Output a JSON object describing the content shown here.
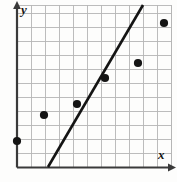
{
  "chart_data": {
    "type": "scatter",
    "title": "",
    "subtitle": "",
    "xlabel": "x",
    "ylabel": "y",
    "grid": true,
    "legend": null,
    "xlim": [
      0,
      11
    ],
    "ylim": [
      0,
      11.6
    ],
    "xticks": [
      0,
      1,
      2,
      3,
      4,
      5,
      6,
      7,
      8,
      9,
      10,
      11
    ],
    "yticks": [
      0,
      1,
      2,
      3,
      4,
      5,
      6,
      7,
      8,
      9,
      10,
      11
    ],
    "xticklabels": [],
    "yticklabels": [],
    "points": [
      {
        "x": 0.0,
        "y": 1.7
      },
      {
        "x": 2.0,
        "y": 3.4
      },
      {
        "x": 4.4,
        "y": 4.2
      },
      {
        "x": 6.3,
        "y": 5.9
      },
      {
        "x": 8.4,
        "y": 6.9
      },
      {
        "x": 10.4,
        "y": 9.6
      }
    ],
    "series": [
      {
        "name": "data-points",
        "type": "scatter",
        "marker": "filled-circle",
        "color": "#141414",
        "values": [
          [
            0.0,
            1.7
          ],
          [
            2.0,
            3.4
          ],
          [
            4.4,
            4.2
          ],
          [
            6.3,
            5.9
          ],
          [
            8.4,
            6.9
          ],
          [
            10.4,
            9.6
          ]
        ]
      },
      {
        "name": "trend-line",
        "type": "line",
        "color": "#141414",
        "endpoints": [
          [
            2.3,
            0.0
          ],
          [
            8.6,
            11.6
          ]
        ],
        "annotation": "line of best fit drawn through the scatter"
      }
    ],
    "colors": {
      "background": "#fdfdfc",
      "grid": "#b4b4b4",
      "axis": "#3a3a3a",
      "marker": "#141414",
      "line": "#141414"
    },
    "geometry_px": {
      "plot_left": 17,
      "plot_right": 171,
      "plot_top": 5,
      "plot_bottom": 167,
      "grid_step_x": 14,
      "grid_step_y": 14,
      "points_px": [
        [
          17,
          141
        ],
        [
          44,
          115
        ],
        [
          77,
          104
        ],
        [
          105,
          78
        ],
        [
          138,
          63
        ],
        [
          164,
          23
        ]
      ],
      "marker_radius": 4.1,
      "line_px": [
        [
          48,
          167
        ],
        [
          143,
          5
        ]
      ],
      "line_width": 2.6
    }
  },
  "labels": {
    "x_axis": "x",
    "y_axis": "y"
  },
  "icons": {
    "x_arrow": "x-axis-arrow-icon",
    "y_arrow": "y-axis-arrow-icon"
  }
}
